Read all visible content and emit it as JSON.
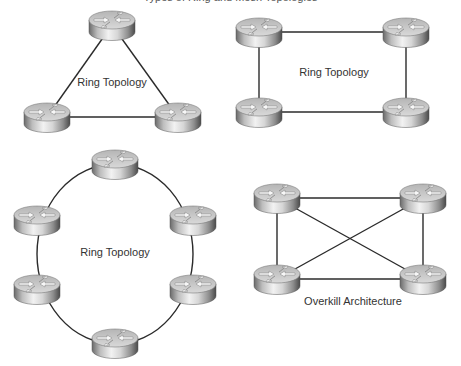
{
  "figure": {
    "clipped_caption": "Types of Ring and Mesh Topologies",
    "colors": {
      "link": "#2b2b2b",
      "router_top": "#c8c8c8",
      "router_side_light": "#e9e9e9",
      "router_side_dark": "#5a5a5a",
      "label_text": "#333333"
    }
  },
  "diagrams": [
    {
      "id": "triangle",
      "label": "Ring Topology",
      "label_pos": [
        112,
        76
      ],
      "routers": [
        [
          112,
          25
        ],
        [
          47,
          117
        ],
        [
          178,
          117
        ]
      ],
      "links": [
        [
          0,
          1
        ],
        [
          1,
          2
        ],
        [
          2,
          0
        ]
      ],
      "curved": false
    },
    {
      "id": "square",
      "label": "Ring Topology",
      "label_pos": [
        334,
        66
      ],
      "routers": [
        [
          259,
          32
        ],
        [
          406,
          32
        ],
        [
          259,
          112
        ],
        [
          406,
          112
        ]
      ],
      "links": [
        [
          0,
          1
        ],
        [
          1,
          3
        ],
        [
          3,
          2
        ],
        [
          2,
          0
        ]
      ],
      "curved": false
    },
    {
      "id": "hexagon",
      "label": "Ring Topology",
      "label_pos": [
        115,
        246
      ],
      "routers": [
        [
          115,
          164
        ],
        [
          37,
          220
        ],
        [
          193,
          220
        ],
        [
          37,
          289
        ],
        [
          193,
          289
        ],
        [
          115,
          343
        ]
      ],
      "ring_center": [
        115,
        254
      ],
      "ring_radius": [
        78,
        90
      ],
      "curved": true
    },
    {
      "id": "mesh",
      "label": "Overkill Architecture",
      "label_pos": [
        353,
        295
      ],
      "routers": [
        [
          277,
          198
        ],
        [
          423,
          198
        ],
        [
          277,
          279
        ],
        [
          423,
          279
        ]
      ],
      "links": [
        [
          0,
          1
        ],
        [
          0,
          2
        ],
        [
          0,
          3
        ],
        [
          1,
          2
        ],
        [
          1,
          3
        ],
        [
          2,
          3
        ]
      ],
      "curved": false
    }
  ]
}
